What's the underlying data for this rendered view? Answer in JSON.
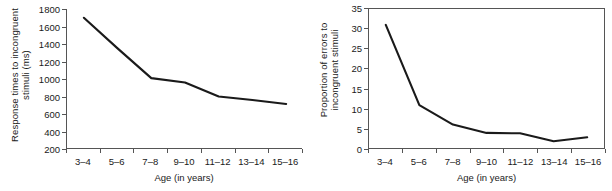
{
  "figure": {
    "background": "#ffffff",
    "line_color": "#1a1a1a",
    "axis_color": "#555555"
  },
  "chart_data": [
    {
      "id": "response-times",
      "type": "line",
      "title": "",
      "xlabel": "Age (in years)",
      "ylabel_line1": "Response times to incongruent",
      "ylabel_line2": "stimuli (ms)",
      "categories": [
        "3–4",
        "5–6",
        "7–8",
        "9–10",
        "11–12",
        "13–14",
        "15–16"
      ],
      "values": [
        1700,
        1350,
        1010,
        960,
        800,
        760,
        715
      ],
      "ylim": [
        200,
        1800
      ],
      "yticks": [
        200,
        400,
        600,
        800,
        1000,
        1200,
        1400,
        1600,
        1800
      ],
      "ytick_labels": [
        "200",
        "400",
        "600",
        "800",
        "1000",
        "1200",
        "1400",
        "1600",
        "1800"
      ],
      "grid": false,
      "legend": "none",
      "frame": "left-bottom"
    },
    {
      "id": "proportion-errors",
      "type": "line",
      "title": "",
      "xlabel": "Age (in years)",
      "ylabel_line1": "Proportion of errors to",
      "ylabel_line2": "incongruent stimuli",
      "categories": [
        "3–4",
        "5–6",
        "7–8",
        "9–10",
        "11–12",
        "13–14",
        "15–16"
      ],
      "values": [
        31,
        10.8,
        5.9,
        3.8,
        3.7,
        1.7,
        2.7
      ],
      "ylim": [
        0,
        35
      ],
      "yticks": [
        0,
        5,
        10,
        15,
        20,
        25,
        30,
        35
      ],
      "ytick_labels": [
        "0",
        "5",
        "10",
        "15",
        "20",
        "25",
        "30",
        "35"
      ],
      "grid": false,
      "legend": "none",
      "frame": "box"
    }
  ]
}
